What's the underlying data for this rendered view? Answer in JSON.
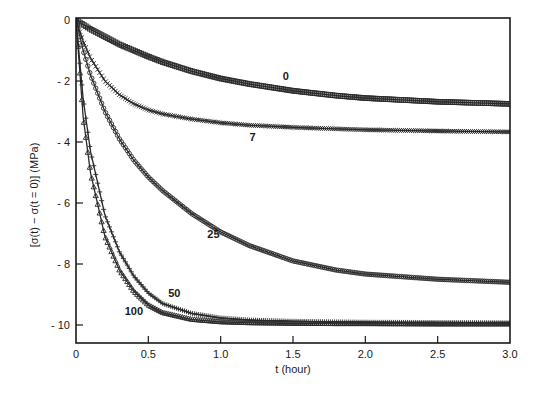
{
  "chart_data": {
    "type": "line",
    "title": "",
    "xlabel": "t (hour)",
    "ylabel": "[σ(t) − σ(t = 0)]   (MPa)",
    "xlim": [
      0,
      3.0
    ],
    "ylim": [
      -10.6,
      0
    ],
    "x_ticks": [
      0,
      0.5,
      1.0,
      1.5,
      2.0,
      2.5,
      3.0
    ],
    "x_tick_labels": [
      "0",
      "0.5",
      "1.0",
      "1.5",
      "2.0",
      "2.5",
      "3.0"
    ],
    "y_ticks": [
      0,
      -2,
      -4,
      -6,
      -8,
      -10
    ],
    "y_tick_labels": [
      "0",
      "- 2",
      "- 4",
      "- 6",
      "- 8",
      "- 10"
    ],
    "grid": false,
    "legend": "inline curve labels",
    "x": [
      0,
      0.05,
      0.1,
      0.2,
      0.3,
      0.4,
      0.5,
      0.6,
      0.8,
      1.0,
      1.2,
      1.5,
      1.8,
      2.0,
      2.5,
      3.0
    ],
    "series": [
      {
        "name": "0",
        "marker": "square",
        "values": [
          0,
          -0.15,
          -0.3,
          -0.55,
          -0.8,
          -1.0,
          -1.2,
          -1.38,
          -1.68,
          -1.92,
          -2.1,
          -2.32,
          -2.48,
          -2.56,
          -2.68,
          -2.75
        ]
      },
      {
        "name": "7",
        "marker": "cross",
        "values": [
          0,
          -0.7,
          -1.25,
          -2.0,
          -2.45,
          -2.75,
          -2.95,
          -3.08,
          -3.25,
          -3.37,
          -3.45,
          -3.52,
          -3.57,
          -3.6,
          -3.64,
          -3.67
        ]
      },
      {
        "name": "25",
        "marker": "circle",
        "values": [
          0,
          -1.0,
          -1.8,
          -3.0,
          -3.9,
          -4.6,
          -5.15,
          -5.6,
          -6.35,
          -6.95,
          -7.4,
          -7.9,
          -8.2,
          -8.33,
          -8.5,
          -8.6
        ]
      },
      {
        "name": "50",
        "marker": "plus",
        "values": [
          0,
          -2.6,
          -4.3,
          -6.4,
          -7.6,
          -8.4,
          -8.95,
          -9.3,
          -9.62,
          -9.77,
          -9.84,
          -9.88,
          -9.9,
          -9.91,
          -9.92,
          -9.93
        ]
      },
      {
        "name": "100",
        "marker": "triangle",
        "values": [
          0,
          -3.2,
          -5.0,
          -7.1,
          -8.2,
          -8.9,
          -9.35,
          -9.6,
          -9.82,
          -9.9,
          -9.93,
          -9.95,
          -9.96,
          -9.96,
          -9.97,
          -9.97
        ]
      }
    ],
    "annotations": [
      {
        "text": "0",
        "x": 1.45,
        "y": -1.85
      },
      {
        "text": "7",
        "x": 1.22,
        "y": -3.85
      },
      {
        "text": "25",
        "x": 0.95,
        "y": -7.0
      },
      {
        "text": "50",
        "x": 0.68,
        "y": -8.95
      },
      {
        "text": "100",
        "x": 0.4,
        "y": -9.55
      }
    ]
  }
}
